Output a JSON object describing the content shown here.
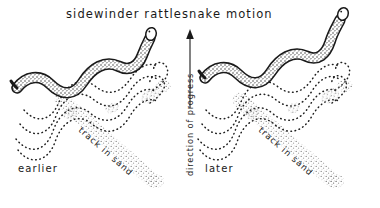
{
  "figure": {
    "title": "sidewinder rattlesnake motion",
    "background_color": "#ffffff",
    "ink_color": "#1a1a1a",
    "sand_color": "#8d8d8d",
    "style": "hand-drawn pen and ink illustration"
  },
  "center_axis": {
    "arrow_label": "direction of progress",
    "arrow_direction": "up",
    "arrow_icon": "up-arrow-icon"
  },
  "panels": [
    {
      "id": "left",
      "time_label": "earlier",
      "track_label": "track in sand",
      "snake_icon": "snake-body-icon",
      "head_icon": "snake-head-icon"
    },
    {
      "id": "right",
      "time_label": "later",
      "track_label": "track in sand",
      "snake_icon": "snake-body-icon",
      "head_icon": "snake-head-icon"
    }
  ]
}
